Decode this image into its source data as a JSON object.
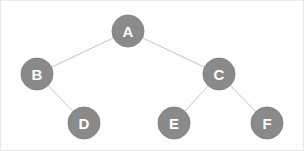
{
  "diagram": {
    "type": "tree-graph",
    "canvas": {
      "width": 304,
      "height": 151,
      "background": "#ffffff",
      "border_color": "#e8e8e8"
    },
    "style": {
      "node_fill": "#8a8a8a",
      "node_stroke": "#828282",
      "node_radius": 16,
      "label_color": "#ffffff",
      "label_font_size": 15,
      "edge_color": "#c2c2c2",
      "edge_width": 1
    },
    "nodes": [
      {
        "id": "A",
        "label": "A",
        "cx": 127,
        "cy": 30,
        "r": 16,
        "role": "root"
      },
      {
        "id": "B",
        "label": "B",
        "cx": 36,
        "cy": 73,
        "r": 16,
        "role": "internal"
      },
      {
        "id": "C",
        "label": "C",
        "cx": 218,
        "cy": 73,
        "r": 16,
        "role": "internal"
      },
      {
        "id": "D",
        "label": "D",
        "cx": 83,
        "cy": 122,
        "r": 16,
        "role": "leaf"
      },
      {
        "id": "E",
        "label": "E",
        "cx": 173,
        "cy": 122,
        "r": 16,
        "role": "leaf"
      },
      {
        "id": "F",
        "label": "F",
        "cx": 266,
        "cy": 122,
        "r": 16,
        "role": "leaf"
      }
    ],
    "edges": [
      {
        "id": "A-B",
        "from": "A",
        "to": "B",
        "x1": 127,
        "y1": 30,
        "x2": 36,
        "y2": 73
      },
      {
        "id": "A-C",
        "from": "A",
        "to": "C",
        "x1": 127,
        "y1": 30,
        "x2": 218,
        "y2": 73
      },
      {
        "id": "B-D",
        "from": "B",
        "to": "D",
        "x1": 36,
        "y1": 73,
        "x2": 83,
        "y2": 122
      },
      {
        "id": "C-E",
        "from": "C",
        "to": "E",
        "x1": 218,
        "y1": 73,
        "x2": 173,
        "y2": 122
      },
      {
        "id": "C-F",
        "from": "C",
        "to": "F",
        "x1": 218,
        "y1": 73,
        "x2": 266,
        "y2": 122
      }
    ]
  }
}
